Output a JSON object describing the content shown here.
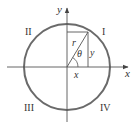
{
  "diagram": {
    "colors": {
      "circle": "#6a6a6a",
      "axis": "#555555",
      "text": "#333333",
      "background": "#ffffff"
    },
    "axes": {
      "x_label": "x",
      "y_label": "y"
    },
    "quadrants": {
      "q1": "I",
      "q2": "II",
      "q3": "III",
      "q4": "IV"
    },
    "triangle": {
      "hypotenuse_label": "r",
      "angle_label": "θ",
      "opposite_label": "y",
      "adjacent_label": "x"
    }
  }
}
